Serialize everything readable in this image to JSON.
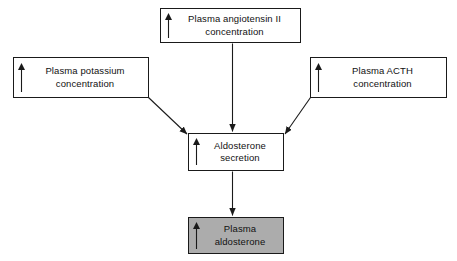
{
  "diagram": {
    "type": "flowchart",
    "background_color": "#ffffff",
    "line_color": "#1a1a1a",
    "shaded_fill_color": "#acacac",
    "nodes": [
      {
        "id": "angiotensin",
        "label": "Plasma angiotensin II\nconcentration",
        "indicator": "up-arrow",
        "shaded": false
      },
      {
        "id": "potassium",
        "label": "Plasma potassium\nconcentration",
        "indicator": "up-arrow",
        "shaded": false
      },
      {
        "id": "acth",
        "label": "Plasma ACTH\nconcentration",
        "indicator": "up-arrow",
        "shaded": false
      },
      {
        "id": "secretion",
        "label": "Aldosterone\nsecretion",
        "indicator": "up-arrow",
        "shaded": false
      },
      {
        "id": "plasma_aldosterone",
        "label": "Plasma\naldosterone",
        "indicator": "up-arrow",
        "shaded": true
      }
    ],
    "edges": [
      {
        "id": "angiotensin-to-secretion",
        "from": "angiotensin",
        "to": "secretion",
        "style": "vertical-arrow"
      },
      {
        "id": "potassium-to-secretion",
        "from": "potassium",
        "to": "secretion",
        "style": "diagonal-arrow"
      },
      {
        "id": "acth-to-secretion",
        "from": "acth",
        "to": "secretion",
        "style": "diagonal-arrow"
      },
      {
        "id": "secretion-to-plasma-aldosterone",
        "from": "secretion",
        "to": "plasma_aldosterone",
        "style": "vertical-arrow"
      }
    ]
  }
}
